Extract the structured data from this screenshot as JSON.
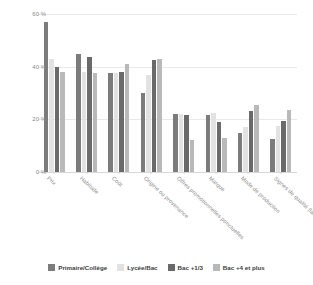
{
  "chart_data": {
    "type": "bar",
    "title": "",
    "xlabel": "",
    "ylabel": "",
    "ylim": [
      0,
      60
    ],
    "grid": true,
    "legend_position": "bottom",
    "ytick_labels": [
      "0 %",
      "20 %",
      "40 %",
      "60 %"
    ],
    "ytick_values": [
      0,
      20,
      40,
      60
    ],
    "categories": [
      "Prix",
      "Habitude",
      "Coût",
      "Origine ou provenance",
      "Offres promotionnelles ponctuelles",
      "Marque",
      "Mode de production",
      "Signes de qualité (labels, AOC, IGP...)"
    ],
    "series": [
      {
        "name": "Primaire/Collège",
        "color": "#7c7c7c",
        "values": [
          57,
          45,
          37.5,
          30,
          22,
          21.5,
          15,
          12.5
        ]
      },
      {
        "name": "Lycée/Bac",
        "color": "#e2e2e2",
        "values": [
          43,
          38,
          37.5,
          37,
          22,
          22.5,
          17,
          17.5
        ]
      },
      {
        "name": "Bac +1/3",
        "color": "#6a6a6a",
        "values": [
          40,
          43.5,
          38,
          42.5,
          21.5,
          19,
          23,
          19.5
        ]
      },
      {
        "name": "Bac +4 et plus",
        "color": "#b9b9b9",
        "values": [
          38,
          37.5,
          41,
          43,
          12,
          13,
          25.5,
          23.5
        ]
      }
    ]
  },
  "legend": {
    "items": [
      {
        "label": "Primaire/Collège",
        "color": "#7c7c7c"
      },
      {
        "label": "Lycée/Bac",
        "color": "#e2e2e2"
      },
      {
        "label": "Bac +1/3",
        "color": "#6a6a6a"
      },
      {
        "label": "Bac +4 et plus",
        "color": "#b9b9b9"
      }
    ]
  }
}
